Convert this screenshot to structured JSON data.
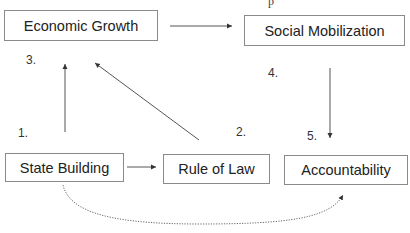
{
  "diagram": {
    "nodes": {
      "economic_growth": {
        "label": "Economic Growth"
      },
      "social_mobilization": {
        "label": "Social Mobilization"
      },
      "state_building": {
        "label": "State Building"
      },
      "rule_of_law": {
        "label": "Rule of Law"
      },
      "accountability": {
        "label": "Accountability"
      }
    },
    "step_numbers": {
      "one": "1.",
      "two": "2.",
      "three": "3.",
      "four": "4.",
      "five": "5."
    },
    "edges": [
      {
        "from": "Economic Growth",
        "to": "Social Mobilization",
        "style": "solid"
      },
      {
        "from": "Social Mobilization",
        "to": "Accountability",
        "style": "solid"
      },
      {
        "from": "State Building",
        "to": "Economic Growth",
        "style": "solid"
      },
      {
        "from": "Rule of Law",
        "to": "Economic Growth",
        "style": "solid"
      },
      {
        "from": "State Building",
        "to": "Rule of Law",
        "style": "solid"
      },
      {
        "from": "State Building",
        "to": "Accountability",
        "style": "dotted"
      }
    ],
    "colors": {
      "line": "#555555",
      "border": "#8a8a8a",
      "text": "#222222"
    }
  }
}
